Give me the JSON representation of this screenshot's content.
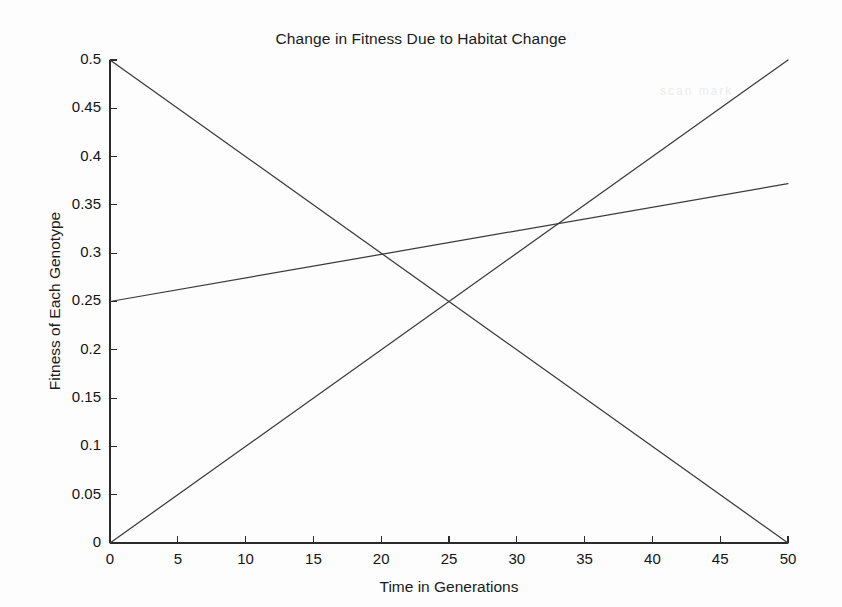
{
  "chart_data": {
    "type": "line",
    "title": "Change in Fitness Due to Habitat Change",
    "xlabel": "Time in Generations",
    "ylabel": "Fitness of Each Genotype",
    "xlim": [
      0,
      50
    ],
    "ylim": [
      0,
      0.5
    ],
    "grid": false,
    "legend": "none",
    "xticks": [
      0,
      5,
      10,
      15,
      20,
      25,
      30,
      35,
      40,
      45,
      50
    ],
    "xticklabels": [
      "0",
      "5",
      "10",
      "15",
      "20",
      "25",
      "30",
      "35",
      "40",
      "45",
      "50"
    ],
    "yticks": [
      0,
      0.05,
      0.1,
      0.15,
      0.2,
      0.25,
      0.3,
      0.35,
      0.4,
      0.45,
      0.5
    ],
    "yticklabels": [
      "0",
      "0.05",
      "0.1",
      "0.15",
      "0.2",
      "0.25",
      "0.3",
      "0.35",
      "0.4",
      "0.45",
      "0.5"
    ],
    "x": [
      0,
      50
    ],
    "series": [
      {
        "name": "declining-genotype",
        "description": "decreasing line from 0.5 to 0",
        "color": "#3a3a3a",
        "x": [
          0,
          50
        ],
        "values": [
          0.5,
          0.0
        ]
      },
      {
        "name": "rising-genotype",
        "description": "increasing line from 0 to 0.5",
        "color": "#3a3a3a",
        "x": [
          0,
          50
        ],
        "values": [
          0.0,
          0.5
        ]
      },
      {
        "name": "heterozygote-genotype",
        "description": "shallow increasing line from 0.25 to about 0.372",
        "color": "#3a3a3a",
        "x": [
          0,
          50
        ],
        "values": [
          0.25,
          0.372
        ]
      }
    ],
    "intersections": [
      {
        "label": "rising-meets-declining",
        "x": 25,
        "y": 0.25
      },
      {
        "label": "shallow-meets-declining",
        "x": 20,
        "y": 0.3
      },
      {
        "label": "shallow-meets-rising",
        "x": 33.3,
        "y": 0.333
      }
    ]
  },
  "artifact": {
    "text": "scan mark"
  }
}
